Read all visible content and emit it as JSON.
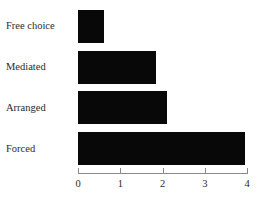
{
  "chart_data": {
    "type": "bar",
    "orientation": "horizontal",
    "title": "",
    "subtitle": "",
    "xlabel": "",
    "ylabel": "",
    "categories": [
      "Free choice",
      "Mediated",
      "Arranged",
      "Forced"
    ],
    "values": [
      0.62,
      1.85,
      2.1,
      3.95
    ],
    "series": [
      {
        "name": "",
        "values": [
          0.62,
          1.85,
          2.1,
          3.95
        ]
      }
    ],
    "xlim": [
      0,
      4
    ],
    "xticks": [
      0,
      1,
      2,
      3,
      4
    ],
    "xtick_labels": [
      "0",
      "1",
      "2",
      "3",
      "4"
    ],
    "grid": false,
    "legend": null,
    "bar_color": "#080808",
    "axis_color": "#8a8a8a",
    "text_color": "#2b2b2b",
    "background_color": "#ffffff"
  },
  "bars": [
    {
      "label": "Free choice",
      "value": 0.62
    },
    {
      "label": "Mediated",
      "value": 1.85
    },
    {
      "label": "Arranged",
      "value": 2.1
    },
    {
      "label": "Forced",
      "value": 3.95
    }
  ],
  "ticks": [
    {
      "label": "0",
      "value": 0
    },
    {
      "label": "1",
      "value": 1
    },
    {
      "label": "2",
      "value": 2
    },
    {
      "label": "3",
      "value": 3
    },
    {
      "label": "4",
      "value": 4
    }
  ]
}
